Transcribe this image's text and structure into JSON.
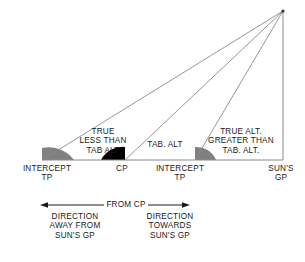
{
  "diagram": {
    "colors": {
      "line": "#8a8a8a",
      "text": "#1a1a1a",
      "angle_gray": "#808080",
      "angle_black": "#000000",
      "background": "#ffffff"
    },
    "apex": {
      "label": "",
      "x": 283,
      "y": 11
    },
    "baseline_y": 160,
    "vertices": [
      {
        "id": "intercept-tp-left",
        "label": "INTERCEPT\nTP",
        "x": 42,
        "angle_fill": "gray"
      },
      {
        "id": "cp",
        "label": "CP",
        "x": 125,
        "angle_fill": "black"
      },
      {
        "id": "intercept-tp-right",
        "label": "INTERCEPT\nTP",
        "x": 195,
        "angle_fill": "gray"
      },
      {
        "id": "suns-gp",
        "label": "SUN'S\nGP",
        "x": 283,
        "angle_fill": "none"
      }
    ],
    "annotations": [
      {
        "id": "true-less-than-tab-alt",
        "lines": [
          "TRUE",
          "LESS THAN",
          "TAB ALT"
        ],
        "x": 103,
        "y": 128
      },
      {
        "id": "tab-alt",
        "lines": [
          "TAB. ALT"
        ],
        "x": 165,
        "y": 141
      },
      {
        "id": "true-alt-greater-than-tab-alt",
        "lines": [
          "TRUE ALT.",
          "GREATER THAN",
          "TAB. ALT."
        ],
        "x": 243,
        "y": 128
      }
    ],
    "scale_bar": {
      "id": "from-cp-scale",
      "label": "FROM CP",
      "left_x": 40,
      "right_x": 190,
      "y": 205,
      "left_arrow": true,
      "right_arrow": true
    },
    "direction_labels": [
      {
        "id": "direction-away",
        "lines": [
          "DIRECTION",
          "AWAY FROM",
          "SUN'S GP"
        ],
        "x": 75,
        "y": 213
      },
      {
        "id": "direction-towards",
        "lines": [
          "DIRECTION",
          "TOWARDS",
          "SUN'S GP"
        ],
        "x": 170,
        "y": 213
      }
    ]
  },
  "labels": {
    "intercept_tp_left_line1": "INTERCEPT",
    "intercept_tp_left_line2": "TP",
    "cp": "CP",
    "intercept_tp_right_line1": "INTERCEPT",
    "intercept_tp_right_line2": "TP",
    "suns_gp_line1": "SUN'S",
    "suns_gp_line2": "GP",
    "true_line1": "TRUE",
    "true_line2": "LESS THAN",
    "true_line3": "TAB ALT",
    "tab_alt": "TAB. ALT",
    "true_alt_line1": "TRUE ALT.",
    "true_alt_line2": "GREATER THAN",
    "true_alt_line3": "TAB. ALT.",
    "from_cp": "FROM CP",
    "dir_away_line1": "DIRECTION",
    "dir_away_line2": "AWAY FROM",
    "dir_away_line3": "SUN'S GP",
    "dir_towards_line1": "DIRECTION",
    "dir_towards_line2": "TOWARDS",
    "dir_towards_line3": "SUN'S GP"
  }
}
